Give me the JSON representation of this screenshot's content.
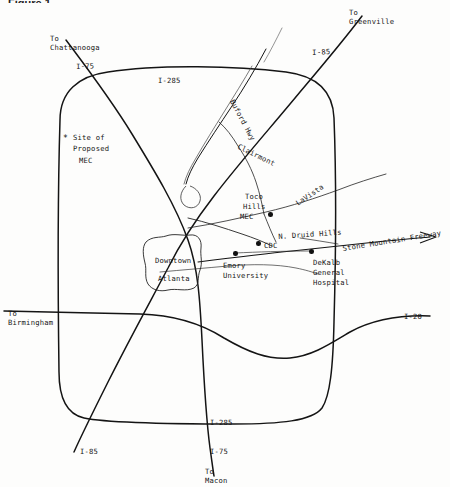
{
  "figure": {
    "title_fragment": "Figure 1."
  },
  "map": {
    "title": "Atlanta Metropolitan Area Map",
    "background_color": "#fdfdfc",
    "ink_color": "#111111",
    "highways": [
      {
        "id": "i285-perimeter",
        "label": "I-285",
        "label_top": "I-285",
        "label_bottom": "I-285"
      },
      {
        "id": "i75",
        "label": "I-75"
      },
      {
        "id": "i85",
        "label": "I-85"
      },
      {
        "id": "i20",
        "label": "I-20"
      },
      {
        "id": "stone-mountain-freeway",
        "label": "Stone Mountain Freeway"
      },
      {
        "id": "buford-hwy",
        "label": "Buford Hwy"
      },
      {
        "id": "clairmont",
        "label": "Clairmont"
      },
      {
        "id": "lavista",
        "label": "LaVista"
      },
      {
        "id": "n-druid-hills",
        "label": "N. Druid Hills"
      }
    ],
    "directions": [
      {
        "id": "to-chattanooga",
        "line1": "To",
        "line2": "Chattanooga"
      },
      {
        "id": "to-greenville",
        "line1": "To",
        "line2": "Greenville"
      },
      {
        "id": "to-birmingham",
        "line1": "To",
        "line2": "Birmingham"
      },
      {
        "id": "to-macon",
        "line1": "To",
        "line2": "Macon"
      }
    ],
    "labels": {
      "i285_top": "I-285",
      "i285_bottom": "I-285",
      "i75_top": "I-75",
      "i75_bottom": "I-75",
      "i85_top": "I-85",
      "i85_bottom": "I-85",
      "i20": "I-20",
      "buford_hwy": "Buford Hwy",
      "clairmont": "Clairmont",
      "lavista": "LaVista",
      "n_druid_hills": "N. Druid Hills",
      "stone_mountain_freeway": "Stone Mountain Freeway"
    },
    "sites": [
      {
        "id": "site-proposed-mec",
        "marker": "star",
        "marker_glyph": "*",
        "line1": "Site of",
        "line2": "Proposed",
        "line3": "MEC"
      },
      {
        "id": "downtown-atlanta",
        "marker": "area",
        "line1": "Downtown",
        "line2": "Atlanta"
      },
      {
        "id": "toco-hills-mec",
        "marker": "dot",
        "line1": "Toco",
        "line2": "Hills",
        "line3": "MEC"
      },
      {
        "id": "cdc",
        "marker": "dot",
        "line1": "CDC"
      },
      {
        "id": "emory-university",
        "marker": "dot",
        "line1": "Emory",
        "line2": "University"
      },
      {
        "id": "dekalb-general-hospital",
        "marker": "dot",
        "line1": "DeKalb",
        "line2": "General",
        "line3": "Hospital"
      }
    ]
  }
}
